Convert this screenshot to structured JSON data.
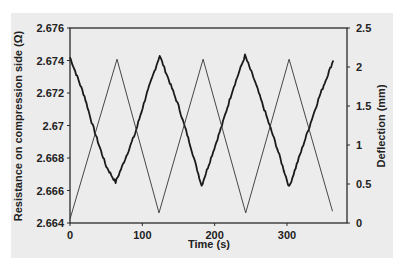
{
  "chart_data": {
    "type": "line",
    "title": "",
    "xlabel": "Time (s)",
    "ylabel": "Resistance on compression side (Ω)",
    "y2label": "Deflection (mm)",
    "xlim": [
      0,
      383
    ],
    "ylim": [
      2.664,
      2.676
    ],
    "y2lim": [
      0,
      2.5
    ],
    "x_ticks": [
      0,
      100,
      200,
      300
    ],
    "x_tick_labels": [
      "0",
      "100",
      "200",
      "300"
    ],
    "y_ticks": [
      2.664,
      2.666,
      2.668,
      2.67,
      2.672,
      2.674,
      2.676
    ],
    "y_tick_labels": [
      "2.664",
      "2.666",
      "2.668",
      "2.67",
      "2.672",
      "2.674",
      "2.676"
    ],
    "y2_ticks": [
      0,
      0.5,
      1,
      1.5,
      2,
      2.5
    ],
    "y2_tick_labels": [
      "0",
      "0.5",
      "1",
      "1.5",
      "2",
      "2.5"
    ],
    "grid": false,
    "legend": null,
    "series": [
      {
        "name": "Resistance on compression side",
        "axis": "left",
        "style": "thick-noisy",
        "color": "#1a1a1a",
        "x": [
          0,
          10,
          20,
          30,
          40,
          50,
          63,
          75,
          90,
          105,
          124,
          135,
          150,
          165,
          182,
          195,
          210,
          225,
          242,
          255,
          270,
          285,
          303,
          315,
          330,
          345,
          364
        ],
        "values": [
          2.6742,
          2.673,
          2.6718,
          2.6702,
          2.6688,
          2.6675,
          2.6665,
          2.6678,
          2.6695,
          2.6718,
          2.6743,
          2.673,
          2.6712,
          2.669,
          2.6663,
          2.668,
          2.67,
          2.6722,
          2.6743,
          2.6728,
          2.6708,
          2.6688,
          2.6662,
          2.6678,
          2.6698,
          2.6718,
          2.674
        ]
      },
      {
        "name": "Deflection",
        "axis": "right",
        "style": "thin",
        "color": "#333333",
        "x": [
          0,
          65,
          123,
          184,
          243,
          303,
          363
        ],
        "values": [
          0.05,
          2.1,
          0.13,
          2.1,
          0.13,
          2.1,
          0.15
        ]
      }
    ]
  }
}
